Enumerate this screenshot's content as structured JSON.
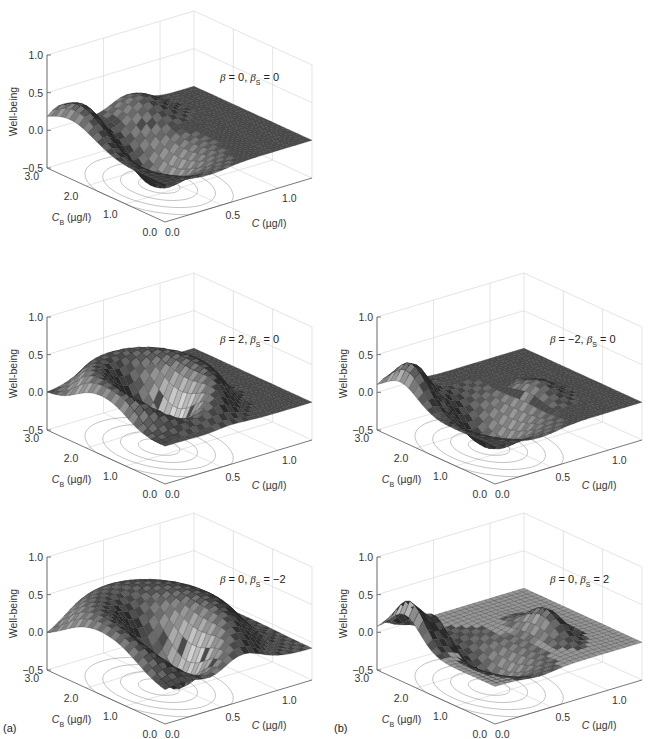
{
  "figure": {
    "sublabels": {
      "a": "(a)",
      "b": "(b)"
    }
  },
  "chart_data": [
    {
      "id": "a-top",
      "type": "surface3d",
      "column": "a",
      "annotation": {
        "beta": "0",
        "beta_s": "0",
        "text": "β = 0, βS = 0"
      },
      "zlabel": "Well-being",
      "xlabel": "C (µg/l)",
      "ylabel": "CB (µg/l)",
      "zticks": [
        "1.0",
        "0.5",
        "0.0",
        "−0.5"
      ],
      "xticks": [
        "0.0",
        "0.5",
        "1.0"
      ],
      "yticks": [
        "0.0",
        "1.0",
        "2.0",
        "3.0"
      ],
      "zlim": [
        -0.5,
        1.0
      ],
      "xlim": [
        0,
        1.3
      ],
      "ylim": [
        0,
        3.0
      ],
      "features": {
        "peak_max": 0.4,
        "trough_min": -0.5,
        "shape": "ridge near CB≈2-3 at low C, dip near C≈0.3-0.5"
      }
    },
    {
      "id": "a-mid",
      "type": "surface3d",
      "column": "a",
      "annotation": {
        "beta": "2",
        "beta_s": "0",
        "text": "β = 2, βS = 0"
      },
      "zlabel": "Well-being",
      "xlabel": "C (µg/l)",
      "ylabel": "CB (µg/l)",
      "zticks": [
        "1.0",
        "0.5",
        "0.0",
        "−0.5"
      ],
      "xticks": [
        "0.0",
        "0.5",
        "1.0"
      ],
      "yticks": [
        "0.0",
        "1.0",
        "2.0",
        "3.0"
      ],
      "zlim": [
        -0.5,
        1.0
      ],
      "xlim": [
        0,
        1.3
      ],
      "ylim": [
        0,
        3.0
      ],
      "features": {
        "peak_max": 0.5,
        "trough_min": -0.5,
        "shape": "flat-topped plateau ≈0.5, deep dip ≈-0.5"
      }
    },
    {
      "id": "a-bottom",
      "type": "surface3d",
      "column": "a",
      "annotation": {
        "beta": "0",
        "beta_s": "−2",
        "text": "β = 0, βS = −2"
      },
      "zlabel": "Well-being",
      "xlabel": "C (µg/l)",
      "ylabel": "CB (µg/l)",
      "zticks": [
        "1.0",
        "0.5",
        "0.0",
        "−0.5"
      ],
      "xticks": [
        "0.0",
        "0.5",
        "1.0"
      ],
      "yticks": [
        "0.0",
        "1.0",
        "2.0",
        "3.0"
      ],
      "zlim": [
        -0.5,
        1.0
      ],
      "xlim": [
        0,
        1.3
      ],
      "ylim": [
        0,
        3.0
      ],
      "features": {
        "peak_max": 0.5,
        "trough_min": -0.5,
        "shape": "broad dome ≈0.5 with central dip ≈-0.5"
      }
    },
    {
      "id": "b-mid",
      "type": "surface3d",
      "column": "b",
      "annotation": {
        "beta": "−2",
        "beta_s": "0",
        "text": "β = −2, βS = 0"
      },
      "zlabel": "Well-being",
      "xlabel": "C (µg/l)",
      "ylabel": "CB (µg/l)",
      "zticks": [
        "1.0",
        "0.5",
        "0.0",
        "−0.5"
      ],
      "xticks": [
        "0.0",
        "0.5",
        "1.0"
      ],
      "yticks": [
        "0.0",
        "1.0",
        "2.0",
        "3.0"
      ],
      "zlim": [
        -0.5,
        1.0
      ],
      "xlim": [
        0,
        1.3
      ],
      "ylim": [
        0,
        3.0
      ],
      "features": {
        "peak_max": 0.4,
        "second_peak": 0.15,
        "trough_min": -0.45,
        "shape": "two peaks separated by dip"
      }
    },
    {
      "id": "b-bottom",
      "type": "surface3d",
      "column": "b",
      "annotation": {
        "beta": "0",
        "beta_s": "2",
        "text": "β = 0, βS = 2"
      },
      "zlabel": "Well-being",
      "xlabel": "C (µg/l)",
      "ylabel": "CB (µg/l)",
      "zticks": [
        "1.0",
        "0.5",
        "0.0",
        "−0.5"
      ],
      "xticks": [
        "0.0",
        "0.5",
        "1.0"
      ],
      "yticks": [
        "0.0",
        "1.0",
        "2.0",
        "3.0"
      ],
      "zlim": [
        -0.5,
        1.0
      ],
      "xlim": [
        0,
        1.3
      ],
      "ylim": [
        0,
        3.0
      ],
      "features": {
        "peak_max": 0.45,
        "second_peak": 0.15,
        "trough_min": -0.4,
        "shape": "two sharp peaks, shallow dip between"
      }
    }
  ],
  "labels": {
    "zlabel": "Well-being",
    "c_italic": "C",
    "cb_italic": "C",
    "cb_sub": "B",
    "unit": " (µg/l)",
    "beta": "β",
    "eq": " = ",
    "comma": ", ",
    "sub_s": "S"
  }
}
